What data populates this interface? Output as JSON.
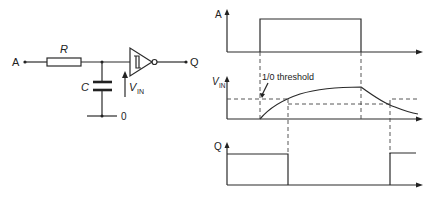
{
  "circuit": {
    "input_label": "A",
    "resistor_label": "R",
    "capacitor_label": "C",
    "ground_label": "0",
    "vin_label_main": "V",
    "vin_label_sub": "IN",
    "output_label": "Q",
    "gate_type": "schmitt-trigger-inverter"
  },
  "waveforms": {
    "a": {
      "label": "A"
    },
    "vin": {
      "label_main": "V",
      "label_sub": "IN",
      "annotation": "1/0 threshold"
    },
    "q": {
      "label": "Q"
    }
  }
}
